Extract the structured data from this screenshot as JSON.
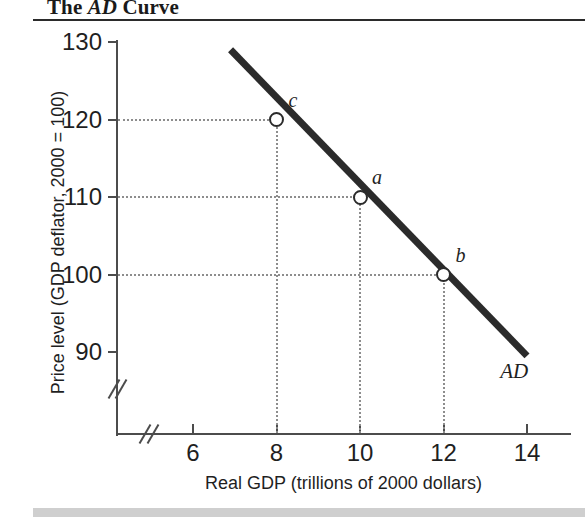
{
  "figure": {
    "title_prefix": "The ",
    "title_italic": "AD",
    "title_suffix": " Curve"
  },
  "chart_data": {
    "type": "line",
    "title": "The AD Curve",
    "xlabel": "Real GDP (trillions of 2000 dollars)",
    "ylabel": "Price level (GDP deflator, 2000 = 100)",
    "xlim": [
      5.2,
      14.7
    ],
    "ylim": [
      88,
      131
    ],
    "xticks": [
      6,
      8,
      10,
      12,
      14
    ],
    "xtick_labels": [
      "6",
      "8",
      "10",
      "12",
      "14"
    ],
    "yticks": [
      90,
      100,
      110,
      120,
      130
    ],
    "ytick_labels": [
      "90",
      "100",
      "110",
      "120",
      "130"
    ],
    "grid": false,
    "axis_break_x": true,
    "axis_break_y": true,
    "legend": "none",
    "series": [
      {
        "name": "AD",
        "label": "AD",
        "color": "#2b2b2b",
        "x": [
          6.9,
          14.0
        ],
        "y": [
          129.0,
          89.5
        ]
      }
    ],
    "points": [
      {
        "label": "c",
        "x": 8,
        "y": 120,
        "guide_h": true,
        "guide_v": true
      },
      {
        "label": "a",
        "x": 10,
        "y": 110,
        "guide_h": true,
        "guide_v": true
      },
      {
        "label": "b",
        "x": 12,
        "y": 100,
        "guide_h": true,
        "guide_v": true
      }
    ],
    "annotations": [
      {
        "text": "AD",
        "x": 13.6,
        "y": 87.5
      }
    ]
  }
}
